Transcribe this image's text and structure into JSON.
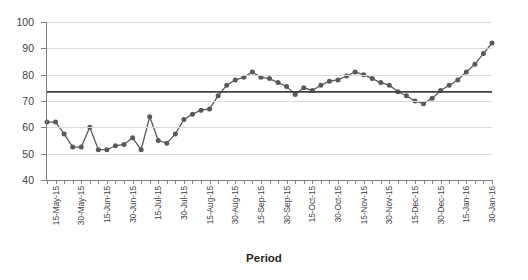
{
  "chart_data": {
    "type": "line",
    "title": "",
    "subtitle": "",
    "xlabel": "Period",
    "ylabel": "",
    "ylim": [
      40,
      100
    ],
    "ytick_values": [
      40,
      50,
      60,
      70,
      80,
      90,
      100
    ],
    "grid": true,
    "legend": "none",
    "x_tick_labels": [
      "15-May-15",
      "30-May-15",
      "15-Jun-15",
      "30-Jun-15",
      "15-Jul-15",
      "30-Jul-15",
      "15-Aug-15",
      "30-Aug-15",
      "15-Sep-15",
      "30-Sep-15",
      "15-Oct-15",
      "30-Oct-15",
      "15-Nov-15",
      "30-Nov-15",
      "15-Dec-15",
      "30-Dec-15",
      "15-Jan-16",
      "30-Jan-16"
    ],
    "x_label_every_nth_tick": 3,
    "n_points": 53,
    "series": [
      {
        "name": "Measurement",
        "color": "#595959",
        "marker": "circle",
        "values": [
          62,
          62,
          57.5,
          52.5,
          52.5,
          60,
          51.5,
          51.5,
          53,
          53.5,
          56,
          51.5,
          64,
          55,
          54,
          57.5,
          63,
          65,
          66.5,
          67,
          72,
          76,
          78,
          79,
          81,
          79,
          78.5,
          77,
          75.5,
          72.5,
          75,
          74,
          76,
          77.5,
          78,
          79.5,
          81,
          80,
          78.5,
          77,
          76,
          73.5,
          72,
          70,
          69,
          71,
          74,
          76,
          78,
          81,
          84,
          88,
          92
        ]
      }
    ],
    "reference_line": {
      "name": "mean-line",
      "value": 73.5,
      "color": "#404040"
    }
  }
}
